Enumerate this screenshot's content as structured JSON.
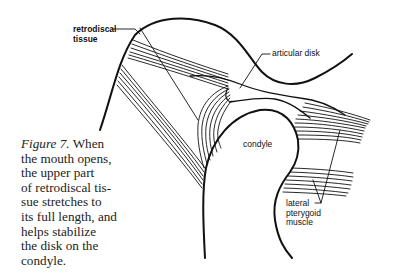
{
  "labels": {
    "retrodiscal": [
      "retrodiscal",
      "tissue"
    ],
    "articular_disk": "articular disk",
    "condyle": "condyle",
    "lateral_pterygoid": [
      "lateral",
      "pterygoid",
      "muscle"
    ]
  },
  "caption": {
    "figure_label": "Figure 7.",
    "first_line_rest": " When",
    "lines": [
      "the mouth opens,",
      "the upper part",
      "of retrodiscal tis-",
      "sue stretches to",
      "its full length, and",
      "helps stabilize",
      "the disk on the",
      "condyle."
    ]
  },
  "colors": {
    "line": "#111111",
    "text": "#222222",
    "background": "#ffffff"
  }
}
